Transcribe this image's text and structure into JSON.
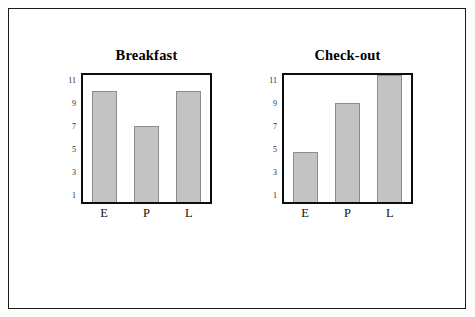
{
  "figure": {
    "border_color": "#1a1a1a",
    "background": "#ffffff"
  },
  "chart_data": [
    {
      "type": "bar",
      "title": "Breakfast",
      "categories": [
        "E",
        "P",
        "L"
      ],
      "values": [
        10,
        7,
        10
      ],
      "xlabel": "",
      "ylabel": "",
      "ylim": [
        0.4,
        11.4
      ],
      "yticks": [
        11,
        9,
        7,
        5,
        3,
        1
      ],
      "ytick_labels": [
        "11",
        "9",
        "7",
        "5",
        "3",
        "1"
      ],
      "grid": false,
      "legend": "none",
      "bar_color": "#c3c3c3",
      "bar_edge_color": "#8c8c8c"
    },
    {
      "type": "bar",
      "title": "Check-out",
      "categories": [
        "E",
        "P",
        "L"
      ],
      "values": [
        4.7,
        9,
        11.4
      ],
      "xlabel": "",
      "ylabel": "",
      "ylim": [
        0.4,
        11.4
      ],
      "yticks": [
        11,
        9,
        7,
        5,
        3,
        1
      ],
      "ytick_labels": [
        "11",
        "9",
        "7",
        "5",
        "3",
        "1"
      ],
      "grid": false,
      "legend": "none",
      "bar_color": "#c3c3c3",
      "bar_edge_color": "#8c8c8c"
    }
  ]
}
